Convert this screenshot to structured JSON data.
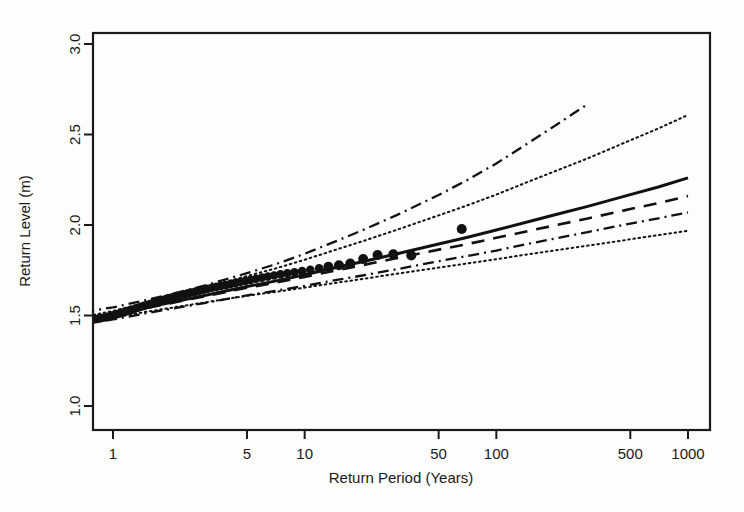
{
  "chart_data": {
    "type": "line",
    "title": "",
    "xlabel": "Return Period (Years)",
    "ylabel": "Return Level (m)",
    "xscale": "log",
    "yscale": "linear",
    "xlim": [
      0.68,
      1250
    ],
    "ylim": [
      0.82,
      3.12
    ],
    "grid": false,
    "legend": "none",
    "xticks": [
      1,
      5,
      10,
      50,
      100,
      500,
      1000
    ],
    "xtick_labels": [
      "1",
      "5",
      "10",
      "50",
      "100",
      "500",
      "1000"
    ],
    "yticks": [
      1.0,
      1.5,
      2.0,
      2.5,
      3.0
    ],
    "ytick_labels": [
      "1.0",
      "1.5",
      "2.0",
      "2.5",
      "3.0"
    ],
    "series": [
      {
        "name": "Return level estimate (GPD fit)",
        "style": "solid",
        "x": [
          0.7,
          1,
          1.5,
          2,
          3,
          5,
          7,
          10,
          15,
          20,
          30,
          50,
          70,
          100,
          150,
          200,
          300,
          500,
          700,
          1000
        ],
        "values": [
          1.475,
          1.505,
          1.545,
          1.572,
          1.611,
          1.66,
          1.69,
          1.725,
          1.768,
          1.797,
          1.84,
          1.895,
          1.931,
          1.972,
          2.021,
          2.055,
          2.103,
          2.168,
          2.21,
          2.26
        ]
      },
      {
        "name": "Alternative model estimate",
        "style": "dashed",
        "x": [
          0.7,
          1,
          1.5,
          2,
          3,
          5,
          7,
          10,
          15,
          20,
          30,
          50,
          70,
          100,
          150,
          200,
          300,
          500,
          700,
          1000
        ],
        "values": [
          1.472,
          1.502,
          1.542,
          1.568,
          1.606,
          1.653,
          1.681,
          1.713,
          1.752,
          1.778,
          1.816,
          1.864,
          1.894,
          1.929,
          1.969,
          1.997,
          2.036,
          2.088,
          2.121,
          2.16
        ]
      },
      {
        "name": "Upper 95% confidence limit (dotted)",
        "style": "dotted",
        "x": [
          0.7,
          1,
          1.5,
          2,
          3,
          5,
          7,
          10,
          15,
          20,
          30,
          50,
          70,
          100,
          150,
          200,
          300,
          500,
          700,
          1000
        ],
        "values": [
          1.492,
          1.525,
          1.572,
          1.605,
          1.654,
          1.718,
          1.759,
          1.808,
          1.868,
          1.91,
          1.972,
          2.053,
          2.107,
          2.168,
          2.243,
          2.295,
          2.368,
          2.468,
          2.533,
          2.608
        ]
      },
      {
        "name": "Lower 95% confidence limit (dotted)",
        "style": "dotted",
        "x": [
          0.7,
          1,
          1.5,
          2,
          3,
          5,
          7,
          10,
          15,
          20,
          30,
          50,
          70,
          100,
          150,
          200,
          300,
          500,
          700,
          1000
        ],
        "values": [
          1.462,
          1.488,
          1.521,
          1.542,
          1.572,
          1.609,
          1.63,
          1.654,
          1.683,
          1.702,
          1.73,
          1.765,
          1.787,
          1.811,
          1.84,
          1.859,
          1.886,
          1.921,
          1.944,
          1.968
        ]
      },
      {
        "name": "Upper profile likelihood limit (dash-dot)",
        "style": "dashdot",
        "x": [
          0.7,
          1,
          1.5,
          2,
          3,
          5,
          7,
          10,
          15,
          20,
          30,
          50,
          70,
          100,
          150,
          200,
          250,
          300
        ],
        "values": [
          1.519,
          1.545,
          1.586,
          1.617,
          1.665,
          1.734,
          1.782,
          1.841,
          1.916,
          1.971,
          2.053,
          2.166,
          2.246,
          2.34,
          2.459,
          2.545,
          2.613,
          2.668
        ]
      },
      {
        "name": "Lower profile likelihood limit (dash-dot)",
        "style": "dashdot",
        "x": [
          0.7,
          1,
          1.5,
          2,
          3,
          5,
          7,
          10,
          15,
          20,
          30,
          50,
          70,
          100,
          150,
          200,
          300,
          500,
          700,
          1000
        ],
        "values": [
          1.452,
          1.478,
          1.513,
          1.536,
          1.569,
          1.611,
          1.636,
          1.664,
          1.698,
          1.721,
          1.755,
          1.8,
          1.828,
          1.859,
          1.898,
          1.924,
          1.961,
          2.008,
          2.037,
          2.07
        ]
      }
    ],
    "scatter": {
      "name": "Empirical return level observations",
      "marker": "filled-circle",
      "x": [
        0.72,
        0.75,
        0.78,
        0.81,
        0.84,
        0.87,
        0.9,
        0.94,
        0.97,
        1.0,
        1.04,
        1.08,
        1.12,
        1.16,
        1.2,
        1.25,
        1.3,
        1.35,
        1.4,
        1.45,
        1.5,
        1.56,
        1.62,
        1.68,
        1.75,
        1.82,
        1.9,
        1.98,
        2.06,
        2.15,
        2.25,
        2.35,
        2.46,
        2.57,
        2.7,
        2.83,
        2.97,
        3.12,
        3.28,
        3.46,
        3.65,
        3.86,
        4.08,
        4.33,
        4.6,
        4.9,
        5.22,
        5.58,
        5.98,
        6.42,
        6.92,
        7.48,
        8.12,
        8.85,
        9.7,
        10.7,
        11.9,
        13.3,
        15.1,
        17.3,
        20.2,
        24.0,
        29.0,
        36.0,
        66.0
      ],
      "values": [
        1.472,
        1.474,
        1.477,
        1.48,
        1.483,
        1.486,
        1.489,
        1.493,
        1.497,
        1.501,
        1.506,
        1.511,
        1.516,
        1.521,
        1.526,
        1.531,
        1.537,
        1.543,
        1.548,
        1.553,
        1.558,
        1.563,
        1.569,
        1.574,
        1.58,
        1.586,
        1.592,
        1.597,
        1.602,
        1.607,
        1.612,
        1.617,
        1.622,
        1.627,
        1.632,
        1.637,
        1.643,
        1.648,
        1.653,
        1.658,
        1.663,
        1.668,
        1.673,
        1.679,
        1.685,
        1.691,
        1.697,
        1.703,
        1.709,
        1.715,
        1.721,
        1.727,
        1.733,
        1.739,
        1.745,
        1.753,
        1.761,
        1.769,
        1.778,
        1.787,
        1.812,
        1.834,
        1.838,
        1.832,
        1.978
      ]
    }
  },
  "colors": {
    "axis": "#1a1a1a",
    "ink": "#111111",
    "background": "#fdfdfc"
  }
}
